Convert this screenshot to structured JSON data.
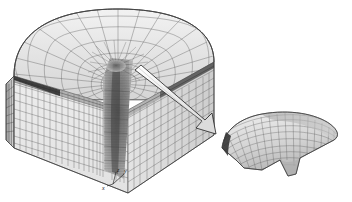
{
  "figure": {
    "background_color": "#ffffff",
    "line_color": "#4a4a4a",
    "fill_light": "#e8e8e8",
    "fill_mid": "#cfcfcf",
    "fill_dark": "#8f8f8f",
    "fill_darkest": "#3a3a3a",
    "arrow_fill": "#f2f2f2",
    "arrow_stroke": "#202020"
  },
  "axes_triad": {
    "name": "coordinate-axis-triad",
    "labels": {
      "x": "x",
      "y": "y",
      "z": "z"
    }
  },
  "main_model": {
    "name": "main-mesh-body",
    "description": "half-disc extruded block, polar surface mesh on top, rectangular mesh on side faces",
    "top_surface": {
      "name": "polar-top-mesh",
      "radial_divisions": 14,
      "circumferential_divisions": 22
    },
    "front_face": {
      "name": "front-face-mesh",
      "columns": 26,
      "rows": 9
    },
    "right_face": {
      "name": "right-face-mesh",
      "columns": 18,
      "rows": 9
    },
    "left_face": {
      "name": "left-face-mesh",
      "columns": 4,
      "rows": 9
    },
    "refined_zone": {
      "name": "refined-crack-tip-mesh",
      "description": "dense vertical column of highly refined elements along the central axis"
    }
  },
  "detail_inset": {
    "name": "detail-inset-mesh",
    "description": "magnified curved shell patch extracted from the crack-tip region",
    "u_divisions": 18,
    "v_divisions": 10
  },
  "callout_arrow": {
    "name": "callout-arrow",
    "direction": "down-right",
    "from": "refined-crack-tip-mesh",
    "to": "detail-inset-mesh"
  }
}
